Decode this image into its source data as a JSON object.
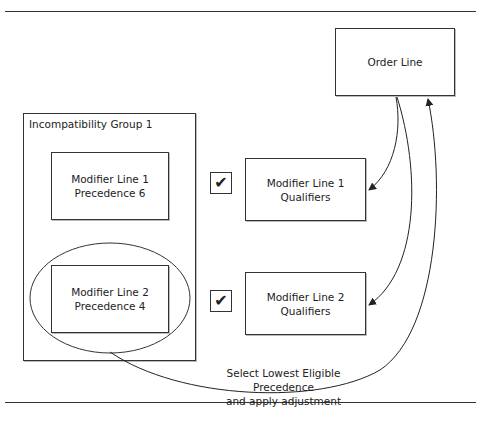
{
  "diagram": {
    "order_line": {
      "label": "Order Line"
    },
    "incompatibility_group": {
      "label": "Incompatibility Group 1",
      "modifier_lines": [
        {
          "line1": "Modifier Line 1",
          "line2": "Precedence 6"
        },
        {
          "line1": "Modifier Line 2",
          "line2": "Precedence 4",
          "selected": true
        }
      ]
    },
    "qualifiers": [
      {
        "line1": "Modifier Line 1",
        "line2": "Qualifiers",
        "check": "✔"
      },
      {
        "line1": "Modifier Line 2",
        "line2": "Qualifiers",
        "check": "✔"
      }
    ],
    "caption": {
      "line1": "Select Lowest Eligible Precedence",
      "line2": "and apply adjustment"
    },
    "arrows": [
      {
        "from": "Order Line",
        "to": "Modifier Line 1 Qualifiers"
      },
      {
        "from": "Order Line",
        "to": "Modifier Line 2 Qualifiers"
      },
      {
        "from": "Modifier Line 2 Precedence 4",
        "to": "Order Line"
      }
    ]
  }
}
